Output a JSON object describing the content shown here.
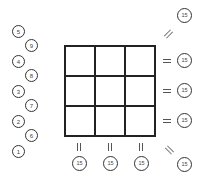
{
  "puzzle": {
    "type": "magic-square",
    "grid_size": 3,
    "magic_sum": "15",
    "number_tiles": [
      "5",
      "9",
      "4",
      "8",
      "3",
      "7",
      "2",
      "6",
      "1"
    ],
    "row_sums": [
      "15",
      "15",
      "15"
    ],
    "column_sums": [
      "15",
      "15",
      "15"
    ],
    "diagonal_sums": {
      "anti_diagonal": "15",
      "main_diagonal": "15"
    },
    "cells": [
      "",
      "",
      "",
      "",
      "",
      "",
      "",
      "",
      ""
    ]
  },
  "colors": {
    "line": "#222222",
    "circle_border": "#333333",
    "text": "#444444",
    "background": "#ffffff"
  }
}
